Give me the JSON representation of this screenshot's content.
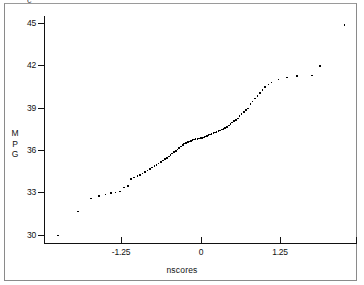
{
  "figure": {
    "top_clip_glyph": "c"
  },
  "chart_data": {
    "type": "scatter",
    "title": "",
    "subtitle": "",
    "xlabel": "nscores",
    "ylabel": "MPG",
    "ylabel_stacked": [
      "M",
      "P",
      "G"
    ],
    "xlim": [
      -2.45,
      2.45
    ],
    "ylim": [
      29.4,
      45.5
    ],
    "xticks": [
      -1.25,
      0,
      1.25
    ],
    "xtick_labels": [
      "-1.25",
      "0",
      "1.25"
    ],
    "yticks": [
      30,
      33,
      36,
      39,
      42,
      45
    ],
    "ytick_labels": [
      "30",
      "33",
      "36",
      "39",
      "42",
      "45"
    ],
    "grid": false,
    "legend": null,
    "marker": "square-dot",
    "marker_color": "#000000",
    "n_points": 88,
    "x": [
      -2.24,
      -1.93,
      -1.73,
      -1.6,
      -1.5,
      -1.41,
      -1.34,
      -1.27,
      -1.21,
      -1.15,
      -1.1,
      -1.05,
      -1.0,
      -0.96,
      -0.92,
      -0.88,
      -0.84,
      -0.8,
      -0.77,
      -0.73,
      -0.7,
      -0.67,
      -0.63,
      -0.6,
      -0.57,
      -0.54,
      -0.51,
      -0.48,
      -0.46,
      -0.43,
      -0.4,
      -0.37,
      -0.35,
      -0.32,
      -0.29,
      -0.27,
      -0.24,
      -0.21,
      -0.19,
      -0.16,
      -0.14,
      -0.11,
      -0.09,
      -0.06,
      -0.04,
      -0.01,
      0.01,
      0.04,
      0.06,
      0.09,
      0.11,
      0.14,
      0.16,
      0.19,
      0.21,
      0.24,
      0.27,
      0.29,
      0.32,
      0.35,
      0.37,
      0.4,
      0.43,
      0.46,
      0.48,
      0.51,
      0.54,
      0.57,
      0.6,
      0.63,
      0.67,
      0.7,
      0.73,
      0.77,
      0.8,
      0.84,
      0.88,
      0.92,
      0.96,
      1.0,
      1.05,
      1.1,
      1.21,
      1.34,
      1.5,
      1.73,
      1.86,
      2.24
    ],
    "y": [
      30.0,
      31.7,
      32.6,
      32.8,
      32.9,
      33.0,
      33.05,
      33.1,
      33.4,
      33.5,
      34.0,
      34.1,
      34.2,
      34.3,
      34.4,
      34.5,
      34.6,
      34.7,
      34.8,
      34.9,
      35.0,
      35.1,
      35.2,
      35.3,
      35.4,
      35.5,
      35.6,
      35.7,
      35.8,
      35.9,
      36.0,
      36.1,
      36.2,
      36.3,
      36.4,
      36.5,
      36.55,
      36.6,
      36.65,
      36.7,
      36.75,
      36.8,
      36.82,
      36.85,
      36.88,
      36.9,
      36.92,
      36.95,
      37.0,
      37.05,
      37.1,
      37.15,
      37.2,
      37.25,
      37.3,
      37.35,
      37.4,
      37.45,
      37.5,
      37.55,
      37.6,
      37.7,
      37.8,
      37.9,
      38.0,
      38.1,
      38.2,
      38.3,
      38.45,
      38.6,
      38.75,
      38.9,
      39.0,
      39.3,
      39.5,
      39.7,
      39.9,
      40.1,
      40.3,
      40.5,
      40.7,
      40.85,
      41.05,
      41.2,
      41.3,
      41.35,
      42.0,
      44.9
    ]
  }
}
